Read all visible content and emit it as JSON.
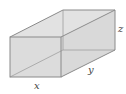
{
  "diagram": {
    "type": "rectangular-box",
    "labels": {
      "x": "x",
      "y": "y",
      "z": "z"
    },
    "colors": {
      "face": "#dedede",
      "edge": "#8a8a8a",
      "label": "#444444"
    }
  }
}
